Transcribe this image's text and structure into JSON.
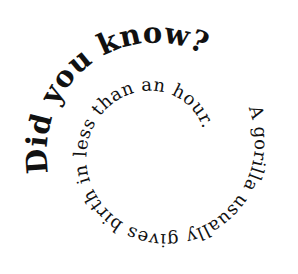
{
  "title": "Did you know?",
  "fact": "A gorilla usually gives birth in less than an hour.",
  "segments": {
    "heading": "Did you know?",
    "body": "A gorilla usually gives birth in less than an hour."
  },
  "colors": {
    "text": "#111111",
    "background": "#ffffff"
  }
}
